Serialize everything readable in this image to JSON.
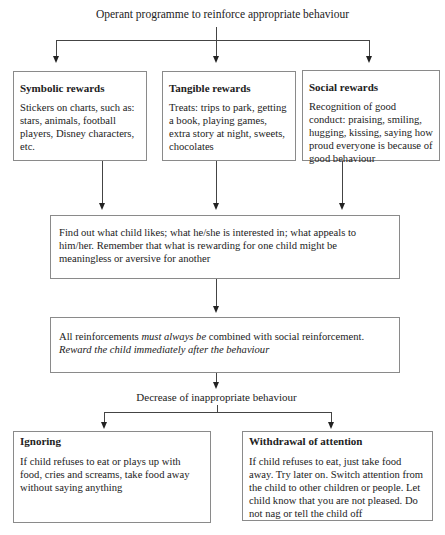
{
  "diagram": {
    "title": "Operant programme to reinforce appropriate behaviour",
    "rewards": [
      {
        "heading": "Symbolic rewards",
        "text": "Stickers on charts, such as: stars, animals, football players, Disney characters, etc."
      },
      {
        "heading": "Tangible rewards",
        "text": "Treats: trips to park, getting a book, playing games, extra story at night, sweets, chocolates"
      },
      {
        "heading": "Social rewards",
        "text": "Recognition of good conduct: praising, smiling, hugging, kissing, saying how proud everyone is because of good behaviour"
      }
    ],
    "find_out": "Find out what child likes; what he/she is interested in; what appeals to him/her. Remember that what is rewarding for one child might be meaningless or aversive for another",
    "reinforcement": {
      "part1": "All reinforcements ",
      "part2_italic": "must  always be",
      "part3": " combined with social reinforcement.",
      "line2_italic": "Reward the child immediately after the behaviour"
    },
    "decrease_label": "Decrease of inappropriate behaviour",
    "strategies": [
      {
        "heading": "Ignoring",
        "text": "If child refuses to eat or plays up with food, cries and screams, take food away without saying anything"
      },
      {
        "heading": "Withdrawal of attention",
        "text": "If child refuses to eat, just take food away. Try later on. Switch attention from the child to other children or people. Let child know that you are not pleased. Do not nag or tell the child off"
      }
    ]
  }
}
